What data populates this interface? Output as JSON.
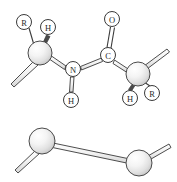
{
  "figure": {
    "kind": "chemical-structure-diagram",
    "background_color": "#ffffff",
    "line_color": "#3a3a3a",
    "label_text_color": "#2b2b2b",
    "sphere_fill_light": "#fdfdfd",
    "sphere_fill_mid": "#e8e8e8",
    "sphere_fill_dark": "#bdbdbd",
    "sphere_outline": "#4a4a4a"
  },
  "top_structure": {
    "name": "peptide-unit",
    "atom_labels": [
      {
        "id": "r-left",
        "text": "R",
        "cx": 24,
        "cy": 22,
        "r": 7.5
      },
      {
        "id": "h-left",
        "text": "H",
        "cx": 48,
        "cy": 27,
        "r": 7.5
      },
      {
        "id": "o-top",
        "text": "O",
        "cx": 112,
        "cy": 19,
        "r": 7.5
      },
      {
        "id": "n-amide",
        "text": "N",
        "cx": 73,
        "cy": 69,
        "r": 7.5
      },
      {
        "id": "c-carbonyl",
        "text": "C",
        "cx": 108,
        "cy": 55,
        "r": 7.5
      },
      {
        "id": "h-amide",
        "text": "H",
        "cx": 71,
        "cy": 100,
        "r": 7.5
      },
      {
        "id": "h-right",
        "text": "H",
        "cx": 130,
        "cy": 98,
        "r": 7.5
      },
      {
        "id": "r-right",
        "text": "R",
        "cx": 152,
        "cy": 93,
        "r": 7.5
      }
    ],
    "spheres": [
      {
        "id": "alpha-carbon-left",
        "cx": 40,
        "cy": 53,
        "r": 12
      },
      {
        "id": "alpha-carbon-right",
        "cx": 138,
        "cy": 74,
        "r": 12
      }
    ],
    "bonds": [
      {
        "id": "bond-ca-left-to-r",
        "style": "thin",
        "from": "alpha-carbon-left",
        "to": "r-left"
      },
      {
        "id": "bond-ca-left-to-h",
        "style": "wedge",
        "from": "alpha-carbon-left",
        "to": "h-left"
      },
      {
        "id": "bond-ca-left-to-chain",
        "style": "tube",
        "from": "alpha-carbon-left",
        "to": "chain-left-terminus"
      },
      {
        "id": "bond-ca-left-to-n",
        "style": "tube",
        "from": "alpha-carbon-left",
        "to": "n-amide"
      },
      {
        "id": "bond-n-to-h",
        "style": "tube",
        "from": "n-amide",
        "to": "h-amide"
      },
      {
        "id": "bond-n-to-c",
        "style": "tube",
        "from": "n-amide",
        "to": "c-carbonyl"
      },
      {
        "id": "bond-c-to-o",
        "style": "double",
        "from": "c-carbonyl",
        "to": "o-top"
      },
      {
        "id": "bond-c-to-ca-right",
        "style": "tube",
        "from": "c-carbonyl",
        "to": "alpha-carbon-right"
      },
      {
        "id": "bond-ca-right-to-chain",
        "style": "tube",
        "from": "alpha-carbon-right",
        "to": "chain-right-terminus"
      },
      {
        "id": "bond-ca-right-to-h",
        "style": "wedge",
        "from": "alpha-carbon-right",
        "to": "h-right"
      },
      {
        "id": "bond-ca-right-to-r",
        "style": "thin",
        "from": "alpha-carbon-right",
        "to": "r-right"
      }
    ]
  },
  "bottom_structure": {
    "name": "backbone-trace",
    "spheres": [
      {
        "id": "backbone-atom-left",
        "cx": 42,
        "cy": 141,
        "r": 13
      },
      {
        "id": "backbone-atom-right",
        "cx": 139,
        "cy": 163,
        "r": 13
      }
    ],
    "bonds": [
      {
        "id": "backbone-bond-left-stub",
        "style": "tube",
        "from": "backbone-atom-left",
        "to": "backbone-left-terminus"
      },
      {
        "id": "backbone-bond-main",
        "style": "tube",
        "from": "backbone-atom-left",
        "to": "backbone-atom-right"
      },
      {
        "id": "backbone-bond-right-stub",
        "style": "tube",
        "from": "backbone-atom-right",
        "to": "backbone-right-terminus"
      }
    ]
  }
}
